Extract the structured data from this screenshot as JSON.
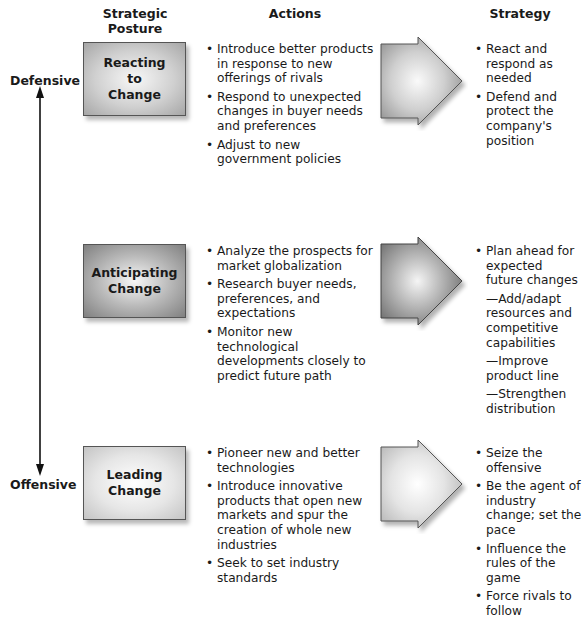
{
  "headers": {
    "posture": "Strategic\nPosture",
    "posture_line1": "Strategic",
    "posture_line2": "Posture",
    "actions": "Actions",
    "strategy": "Strategy"
  },
  "axis": {
    "top_label": "Defensive",
    "bottom_label": "Offensive"
  },
  "rows": [
    {
      "posture_lines": [
        "Reacting",
        "to",
        "Change"
      ],
      "actions": [
        "Introduce better products in response to new offerings of rivals",
        "Respond to unexpected changes in buyer needs and preferences",
        "Adjust to new government policies"
      ],
      "strategy": [
        "React and respond as needed",
        "Defend and protect the company's position"
      ]
    },
    {
      "posture_lines": [
        "Anticipating",
        "Change"
      ],
      "actions": [
        "Analyze the prospects for market globalization",
        "Research buyer needs, preferences, and expectations",
        "Monitor new technological developments closely to predict future path"
      ],
      "strategy": [
        "Plan ahead for expected future changes",
        "—Add/adapt resources and competitive capabilities",
        "—Improve product line",
        "—Strengthen distribution"
      ]
    },
    {
      "posture_lines": [
        "Leading",
        "Change"
      ],
      "actions": [
        "Pioneer new and better technologies",
        "Introduce innovative products that open new markets and spur the creation of whole new industries",
        "Seek to set industry standards"
      ],
      "strategy": [
        "Seize the offensive",
        "Be the agent of industry change; set the pace",
        "Influence the rules of the game",
        "Force rivals to follow"
      ]
    }
  ],
  "colors": {
    "text": "#1a1a1a",
    "box_border": "#555555",
    "reacting_fill": "#c8c8c8",
    "anticipating_fill": "#a8a8a8",
    "leading_fill": "#e2e2e2"
  }
}
